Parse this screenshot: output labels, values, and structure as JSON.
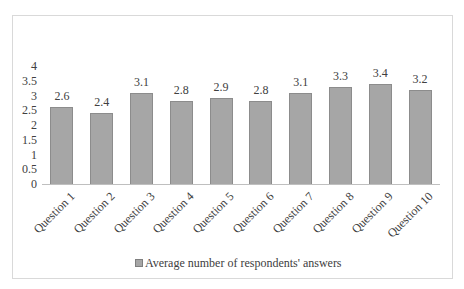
{
  "chart_data": {
    "type": "bar",
    "title": "",
    "xlabel": "",
    "ylabel": "",
    "categories": [
      "Question 1",
      "Question 2",
      "Question 3",
      "Question 4",
      "Question 5",
      "Question 6",
      "Question 7",
      "Question 8",
      "Question 9",
      "Question 10"
    ],
    "series": [
      {
        "name": "Average number of respondents' answers",
        "values": [
          2.6,
          2.4,
          3.1,
          2.8,
          2.9,
          2.8,
          3.1,
          3.3,
          3.4,
          3.2
        ],
        "color": "#a6a6a6"
      }
    ],
    "data_labels": [
      "2.6",
      "2.4",
      "3.1",
      "2.8",
      "2.9",
      "2.8",
      "3.1",
      "3.3",
      "3.4",
      "3.2"
    ],
    "ylim": [
      0,
      4
    ],
    "yticks": [
      "0",
      "0.5",
      "1",
      "1.5",
      "2",
      "2.5",
      "3",
      "3.5",
      "4"
    ],
    "grid": false,
    "legend_position": "bottom"
  },
  "legend": {
    "label": "Average number of respondents' answers"
  }
}
